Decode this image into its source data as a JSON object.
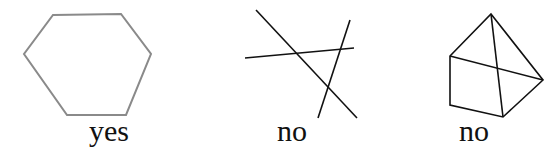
{
  "figures": [
    {
      "name": "hexagon",
      "label": "yes",
      "stroke": "#8a8a8a",
      "points": [
        [
          53,
          15
        ],
        [
          121,
          14
        ],
        [
          151,
          54
        ],
        [
          126,
          115
        ],
        [
          67,
          115
        ],
        [
          24,
          54
        ]
      ]
    },
    {
      "name": "three-lines",
      "label": "no",
      "stroke": "#111111",
      "lines": [
        [
          256,
          10,
          357,
          118
        ],
        [
          245,
          58,
          354,
          48
        ],
        [
          350,
          20,
          318,
          118
        ]
      ]
    },
    {
      "name": "pyramid-shape",
      "label": "no",
      "stroke": "#111111",
      "points": [
        [
          491,
          14
        ],
        [
          543,
          80
        ],
        [
          503,
          117
        ],
        [
          450,
          105
        ],
        [
          450,
          56
        ]
      ],
      "diagonals": [
        [
          491,
          14,
          503,
          117
        ],
        [
          450,
          56,
          543,
          80
        ]
      ]
    }
  ]
}
